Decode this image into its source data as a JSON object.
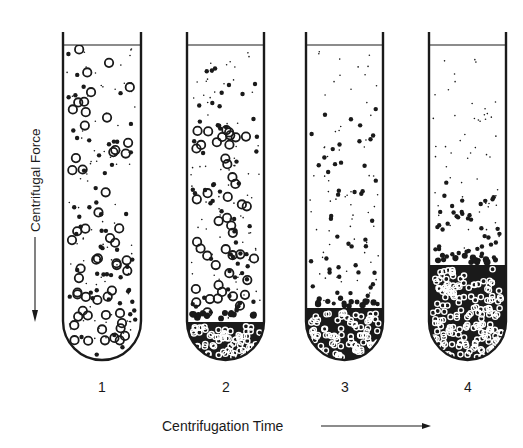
{
  "figure": {
    "y_axis_label": "Centrifugal Force",
    "x_axis_label": "Centrifugation Time",
    "ink_color": "#1a1a1a",
    "background": "#ffffff"
  },
  "tubes": [
    {
      "label": "1",
      "cx": 102,
      "left": 63,
      "right": 141,
      "description": "Uniform suspension: large, medium and small particles evenly dispersed",
      "large_density": 1.0,
      "medium_density": 1.0,
      "small_density": 1.0,
      "large_top": 0.0,
      "medium_top": 0.0,
      "small_top": 0.0,
      "pellet_height": 0
    },
    {
      "label": "2",
      "cx": 226,
      "left": 187,
      "right": 264,
      "description": "Large particles begin sedimenting; small pellet forms",
      "large_density": 1.0,
      "medium_density": 1.0,
      "small_density": 1.0,
      "large_top": 0.3,
      "medium_top": 0.06,
      "small_top": 0.0,
      "pellet_height": 38
    },
    {
      "label": "3",
      "cx": 345,
      "left": 306,
      "right": 383,
      "description": "Large particles fully pelleted; medium particles settling",
      "large_density": 1.0,
      "medium_density": 0.9,
      "small_density": 0.8,
      "large_top": 1.0,
      "medium_top": 0.22,
      "small_top": 0.0,
      "pellet_height": 52
    },
    {
      "label": "4",
      "cx": 468,
      "left": 429,
      "right": 506,
      "description": "Large and medium particles pelleted; only small particles remain in supernatant",
      "large_density": 1.0,
      "medium_density": 1.0,
      "small_density": 0.7,
      "large_top": 1.0,
      "medium_top": 0.62,
      "small_top": 0.05,
      "pellet_height": 95
    }
  ],
  "geometry": {
    "wall_top": 32,
    "rim_y": 45,
    "bottom_y": 360,
    "label_y": 392,
    "wall_width": 2.4
  },
  "particle_legend": {
    "large": "open circle (large particle)",
    "medium": "filled dot (medium particle)",
    "small": "fine speck (small particle)"
  }
}
